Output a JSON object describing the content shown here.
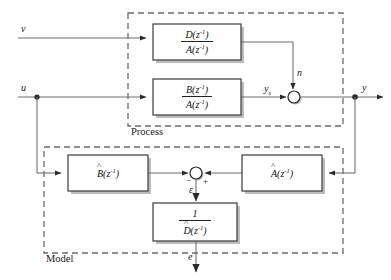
{
  "diagram": {
    "groups": [
      {
        "id": "process",
        "label": "Process"
      },
      {
        "id": "model",
        "label": "Model"
      }
    ],
    "signals": {
      "v": "v",
      "u": "u",
      "n": "n",
      "ys": "y",
      "ys_sub": "s",
      "y": "y",
      "epsilon": "ε",
      "e": "e"
    },
    "signs": {
      "minus": "−",
      "plus": "+"
    },
    "blocks": [
      {
        "id": "disturbance-transfer",
        "numerator": "D",
        "denominator": "A",
        "arg": "(z",
        "exp": "-1",
        "close": ")",
        "hat": false
      },
      {
        "id": "plant-transfer",
        "numerator": "B",
        "denominator": "A",
        "arg": "(z",
        "exp": "-1",
        "close": ")",
        "hat": false
      },
      {
        "id": "b-hat",
        "name": "B",
        "arg": "(z",
        "exp": "-1",
        "close": ")",
        "hat": true
      },
      {
        "id": "a-hat",
        "name": "A",
        "arg": "(z",
        "exp": "-1",
        "close": ")",
        "hat": true
      },
      {
        "id": "d-hat-inverse",
        "numerator": "1",
        "denominator": "D",
        "arg": "(z",
        "exp": "-1",
        "close": ")",
        "hat": true
      }
    ],
    "colors": {
      "line": "#6f6f6f",
      "box_border": "#3a3a3a",
      "dashed": "#6b6b6b",
      "text": "#1a1a1a",
      "shadow": "#b9b9b9",
      "background": "#ffffff"
    }
  }
}
